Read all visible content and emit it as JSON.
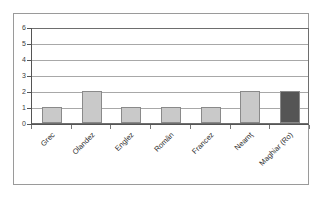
{
  "chart_data": {
    "type": "bar",
    "title": "",
    "subtitle": "",
    "xlabel": "",
    "ylabel": "",
    "categories": [
      "Grec",
      "Olandez",
      "Englez",
      "Român",
      "Francez",
      "Neamţ",
      "Maghiar (Ro)"
    ],
    "values": [
      1,
      2,
      1,
      1,
      1,
      2,
      2
    ],
    "ylim": [
      0,
      6
    ],
    "ytick_labels": [
      "0",
      "1",
      "2",
      "3",
      "4",
      "5",
      "6"
    ],
    "ytick_values": [
      0,
      1,
      2,
      3,
      4,
      5,
      6
    ],
    "grid": "horizontal",
    "legend": "none",
    "bar_colors": [
      "#c9c9c9",
      "#c9c9c9",
      "#c9c9c9",
      "#c9c9c9",
      "#c9c9c9",
      "#c9c9c9",
      "#555555"
    ],
    "series": [
      {
        "name": "",
        "values": [
          1,
          2,
          1,
          1,
          1,
          2,
          2
        ]
      }
    ],
    "colors": {
      "bar_light": "#c9c9c9",
      "bar_dark": "#555555",
      "bar_border": "#8a8a8a",
      "gridline": "#a8a8a8",
      "axis": "#555555",
      "plot_border": "#6e6e6e",
      "outer_frame": "#9a9a9a",
      "background": "#ffffff",
      "tick_text": "#3c3c3c",
      "label_text": "#2e2e2e"
    }
  }
}
